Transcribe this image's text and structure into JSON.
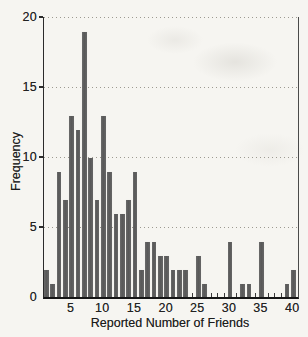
{
  "figure": {
    "bg_color": "#f6f5f1",
    "bar_color": "#5e5e5e",
    "axis_color": "#2a2a2a",
    "grid_color": "#9d9a91"
  },
  "chart_data": {
    "type": "bar",
    "title": "",
    "xlabel": "Reported Number of Friends",
    "ylabel": "Frequency",
    "x": [
      1,
      2,
      3,
      4,
      5,
      6,
      7,
      8,
      9,
      10,
      11,
      12,
      13,
      14,
      15,
      16,
      17,
      18,
      19,
      20,
      21,
      22,
      23,
      24,
      25,
      26,
      27,
      28,
      29,
      30,
      31,
      32,
      33,
      34,
      35,
      36,
      37,
      38,
      39,
      40
    ],
    "values": [
      2,
      1,
      9,
      7,
      13,
      12,
      19,
      10,
      7,
      13,
      9,
      6,
      6,
      7,
      9,
      2,
      4,
      4,
      3,
      3,
      2,
      2,
      2,
      0,
      3,
      1,
      0,
      0,
      0,
      4,
      0,
      1,
      1,
      0,
      4,
      0,
      0,
      0,
      1,
      2
    ],
    "ylim": [
      0,
      20
    ],
    "xlim": [
      0,
      41
    ],
    "yticks": [
      0,
      5,
      10,
      15,
      20
    ],
    "xticks_labeled": [
      5,
      10,
      15,
      20,
      25,
      30,
      35,
      40
    ],
    "xticks_minor_every": 1,
    "gridlines_y": [
      5,
      10,
      15,
      20
    ],
    "grid_style": "dotted-horizontal",
    "legend_position": "none"
  }
}
